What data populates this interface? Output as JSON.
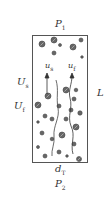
{
  "diagram": {
    "labels": {
      "top_pressure": {
        "main": "P",
        "sub": "1"
      },
      "bottom_pressure": {
        "main": "P",
        "sub": "2"
      },
      "diameter": {
        "main": "d",
        "sub": "T"
      },
      "length": {
        "main": "L",
        "sub": ""
      },
      "solid_superficial_velocity": {
        "main": "U",
        "sub": "s"
      },
      "fluid_superficial_velocity": {
        "main": "U",
        "sub": "f"
      },
      "solid_velocity": {
        "main": "u",
        "sub": "s"
      },
      "fluid_velocity": {
        "main": "u",
        "sub": "f"
      }
    },
    "colors": {
      "stroke": "#444444",
      "particle_fill": "#555555",
      "background": "#ffffff"
    }
  }
}
